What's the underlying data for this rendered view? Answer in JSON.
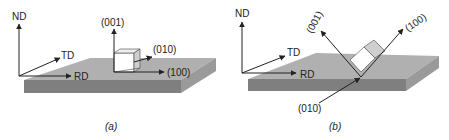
{
  "figure": {
    "colors": {
      "plate_top": "#b0b0b0",
      "plate_front": "#7f7f7f",
      "plate_side": "#9a9a9a",
      "crystal_face_light": "#ffffff",
      "crystal_face_gray": "#cfcfcf",
      "line": "#222222"
    },
    "panels": [
      {
        "id": "a",
        "caption": "(a)",
        "sample_axes": {
          "nd": "ND",
          "td": "TD",
          "rd": "RD"
        },
        "crystal_axes": {
          "z": "(001)",
          "y": "(010)",
          "x": "(100)"
        },
        "orientation": "cube-aligned"
      },
      {
        "id": "b",
        "caption": "(b)",
        "sample_axes": {
          "nd": "ND",
          "td": "TD",
          "rd": "RD"
        },
        "crystal_axes": {
          "z": "(001)",
          "y": "(010)",
          "x": "(100)"
        },
        "orientation": "rotated"
      }
    ]
  }
}
